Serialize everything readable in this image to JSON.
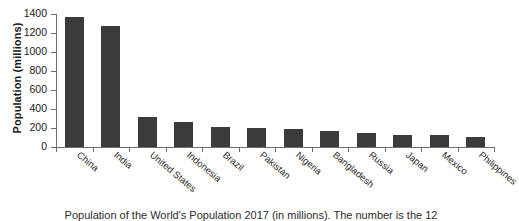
{
  "chart_data": {
    "type": "bar",
    "title": "",
    "subtitle": "",
    "xlabel": "",
    "ylabel": "Population (millions)",
    "ylim": [
      0,
      1400
    ],
    "ytick_labels": [
      "0",
      "200",
      "400",
      "600",
      "800",
      "1000",
      "1200",
      "1400"
    ],
    "ytick_values": [
      0,
      200,
      400,
      600,
      800,
      1000,
      1200,
      1400
    ],
    "grid": false,
    "legend": false,
    "legend_position": "none",
    "bar_color": "#3b3b3b",
    "axis_color": "#6e6e6e",
    "categories": [
      "China",
      "India",
      "United States",
      "Indonesia",
      "Brazil",
      "Pakistan",
      "Nigeria",
      "Bangladesh",
      "Russia",
      "Japan",
      "Mexico",
      "Philippines"
    ],
    "values": [
      1370,
      1270,
      320,
      260,
      210,
      200,
      190,
      165,
      145,
      127,
      130,
      105
    ]
  },
  "caption": {
    "text": "Population of the World's Population 2017 (in millions). The number is the 12"
  }
}
